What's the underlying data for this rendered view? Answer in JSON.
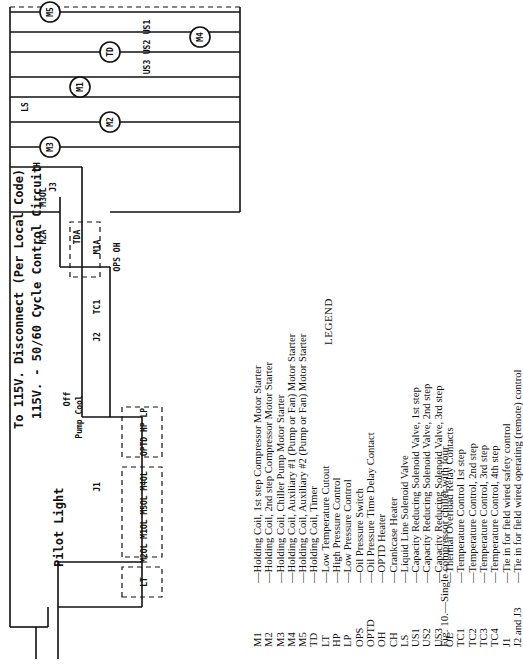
{
  "diagram": {
    "title_line1": "To 115V. Disconnect (Per Local Code)",
    "title_line2": "115V. - 50/60 Cycle Control Circuit",
    "pilot_light_label": "Pilot Light",
    "switch_labels": {
      "off": "Off",
      "pump": "Pump",
      "cool": "Cool"
    },
    "components": [
      "LT",
      "M2OL",
      "M1OL",
      "M5OL",
      "M4OL",
      "J1",
      "OPTD",
      "HP",
      "LP",
      "M3A",
      "J2",
      "TC1",
      "M1A",
      "TDA",
      "M2A",
      "J3",
      "M3OL",
      "CH",
      "LS",
      "M3",
      "M2",
      "M1",
      "TD",
      "OPS",
      "OH",
      "US3",
      "US2",
      "US1",
      "TC4",
      "TC3",
      "TC2",
      "M4",
      "M5"
    ],
    "wire_numbers": [
      "1",
      "2",
      "3",
      "4",
      "5",
      "6",
      "7",
      "8",
      "9",
      "10",
      "11",
      "12",
      "13",
      "14",
      "15",
      "16",
      "17",
      "18",
      "19",
      "20",
      "21",
      "22"
    ]
  },
  "legend": {
    "heading": "LEGEND",
    "items": [
      {
        "code": "M1",
        "desc": "—Holding Coil, 1st step Compressor Motor Starter"
      },
      {
        "code": "M2",
        "desc": "—Holding Coil, 2nd step Compressor Motor Starter"
      },
      {
        "code": "M3",
        "desc": "—Holding Coil, Chiller Pump Motor Starter"
      },
      {
        "code": "M4",
        "desc": "—Holding Coil, Auxiliary #1 (Pump or Fan) Motor Starter"
      },
      {
        "code": "M5",
        "desc": "—Holding Coil, Auxiliary #2 (Pump or Fan) Motor Starter"
      },
      {
        "code": "TD",
        "desc": "—Holding Coil, Timer"
      },
      {
        "code": "LT",
        "desc": "—Low Temperature Cutout"
      },
      {
        "code": "HP",
        "desc": "—High Pressure Control"
      },
      {
        "code": "LP",
        "desc": "—Low Pressure Control"
      },
      {
        "code": "OPS",
        "desc": "—Oil Pressure Switch"
      },
      {
        "code": "OPTD",
        "desc": "—Oil Pressure Time Delay Contact"
      },
      {
        "code": "OH",
        "desc": "—OPTD Heater"
      },
      {
        "code": "CH",
        "desc": "—Crankcase Heater"
      },
      {
        "code": "LS",
        "desc": "—Liquid Line Solenoid Valve"
      },
      {
        "code": "US1",
        "desc": "—Capacity Reducing Solenoid Valve, 1st step"
      },
      {
        "code": "US2",
        "desc": "—Capacity Reducing Solenoid Valve, 2nd step"
      },
      {
        "code": "US3",
        "desc": "—Capacity Reducing Solenoid Valve, 3rd step"
      },
      {
        "code": "OL",
        "desc": "—Thermal Overload Relay Contacts"
      },
      {
        "code": "TC1",
        "desc": "—Temperature Control 1st step"
      },
      {
        "code": "TC2",
        "desc": "—Temperature Control, 2nd step"
      },
      {
        "code": "TC3",
        "desc": "—Temperature Control, 3rd step"
      },
      {
        "code": "TC4",
        "desc": "—Temperature Control, 4th step"
      },
      {
        "code": "J1",
        "desc": "—Tie in for field wired safety control"
      },
      {
        "code": "J2 and J3",
        "desc": "—Tie in for field wired operating (remote) control"
      }
    ]
  },
  "caption": "Fig. 10.—Single compressor chiller with four"
}
